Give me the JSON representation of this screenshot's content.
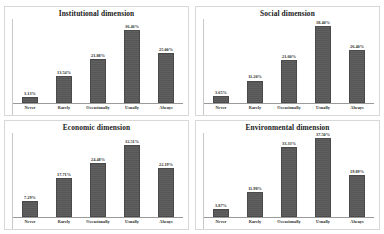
{
  "figure": {
    "background_color": "#ffffff",
    "bar_color": "#595959",
    "panel_border_color": "#d8d8d8",
    "axis_color": "#9a9a9a"
  },
  "chart_data": [
    {
      "type": "bar",
      "title": "Institutional dimension",
      "categories": [
        "Never",
        "Rarely",
        "Occasionally",
        "Usually",
        "Always"
      ],
      "values": [
        3.13,
        13.54,
        21.88,
        36.46,
        25.0
      ],
      "labels": [
        "3.13%",
        "13.54%",
        "21.88%",
        "36.46%",
        "25.00%"
      ],
      "xlabel": "",
      "ylabel": "",
      "ylim": [
        0,
        42
      ],
      "grid": false,
      "legend": false
    },
    {
      "type": "bar",
      "title": "Social dimension",
      "categories": [
        "Never",
        "Rarely",
        "Occasionally",
        "Usually",
        "Always"
      ],
      "values": [
        3.65,
        11.2,
        21.6,
        38.4,
        26.4
      ],
      "labels": [
        "3.65%",
        "11.20%",
        "21.60%",
        "38.40%",
        "26.40%"
      ],
      "xlabel": "",
      "ylabel": "",
      "ylim": [
        0,
        42
      ],
      "grid": false,
      "legend": false
    },
    {
      "type": "bar",
      "title": "Economic dimension",
      "categories": [
        "Never",
        "Rarely",
        "Occasionally",
        "Usually",
        "Always"
      ],
      "values": [
        7.29,
        17.71,
        24.48,
        32.51,
        22.19
      ],
      "labels": [
        "7.29%",
        "17.71%",
        "24.48%",
        "32.51%",
        "22.19%"
      ],
      "xlabel": "",
      "ylabel": "",
      "ylim": [
        0,
        38
      ],
      "grid": false,
      "legend": false
    },
    {
      "type": "bar",
      "title": "Environmental dimension",
      "categories": [
        "Never",
        "Rarely",
        "Occasionally",
        "Usually",
        "Always"
      ],
      "values": [
        3.87,
        11.98,
        33.33,
        37.5,
        19.89
      ],
      "labels": [
        "3.87%",
        "11.98%",
        "33.33%",
        "37.50%",
        "19.89%"
      ],
      "xlabel": "",
      "ylabel": "",
      "ylim": [
        0,
        40
      ],
      "grid": false,
      "legend": false
    }
  ]
}
